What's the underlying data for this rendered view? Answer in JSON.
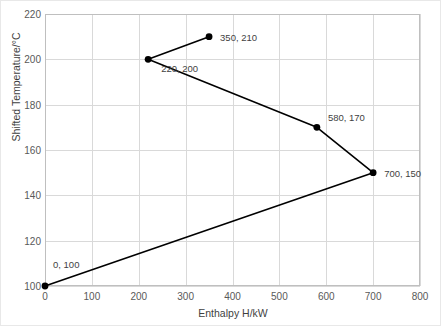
{
  "chart_data": {
    "type": "line",
    "title": "",
    "xlabel": "Enthalpy H/kW",
    "ylabel": "Shifted Temperature/°C",
    "xlim": [
      0,
      800
    ],
    "ylim": [
      100,
      220
    ],
    "xticks": [
      0,
      100,
      200,
      300,
      400,
      500,
      600,
      700,
      800
    ],
    "yticks": [
      100,
      120,
      140,
      160,
      180,
      200,
      220
    ],
    "xtick_labels": [
      "0",
      "100",
      "200",
      "300",
      "400",
      "500",
      "600",
      "700",
      "800"
    ],
    "ytick_labels": [
      "100",
      "120",
      "140",
      "160",
      "180",
      "200",
      "220"
    ],
    "grid": true,
    "legend": "none",
    "series": [
      {
        "name": "Grand Composite Curve",
        "marker": "circle",
        "marker_color": "#000000",
        "line_color": "#000000",
        "x": [
          0,
          700,
          580,
          220,
          350
        ],
        "y": [
          100,
          150,
          170,
          200,
          210
        ],
        "points": [
          {
            "x": 0,
            "y": 100,
            "label": "0, 100",
            "label_dx": 8,
            "label_dy": -22
          },
          {
            "x": 700,
            "y": 150,
            "label": "700, 150",
            "label_dx": 11,
            "label_dy": 0
          },
          {
            "x": 580,
            "y": 170,
            "label": "580, 170",
            "label_dx": 11,
            "label_dy": -10
          },
          {
            "x": 220,
            "y": 200,
            "label": "220, 200",
            "label_dx": 13,
            "label_dy": 9
          },
          {
            "x": 350,
            "y": 210,
            "label": "350, 210",
            "label_dx": 11,
            "label_dy": 0
          }
        ]
      }
    ],
    "colors": {
      "grid": "#d9d9d9",
      "axis": "#bfbfbf",
      "text": "#3f3f3f",
      "tick_text": "#595959",
      "series": "#000000",
      "background": "#ffffff"
    }
  }
}
